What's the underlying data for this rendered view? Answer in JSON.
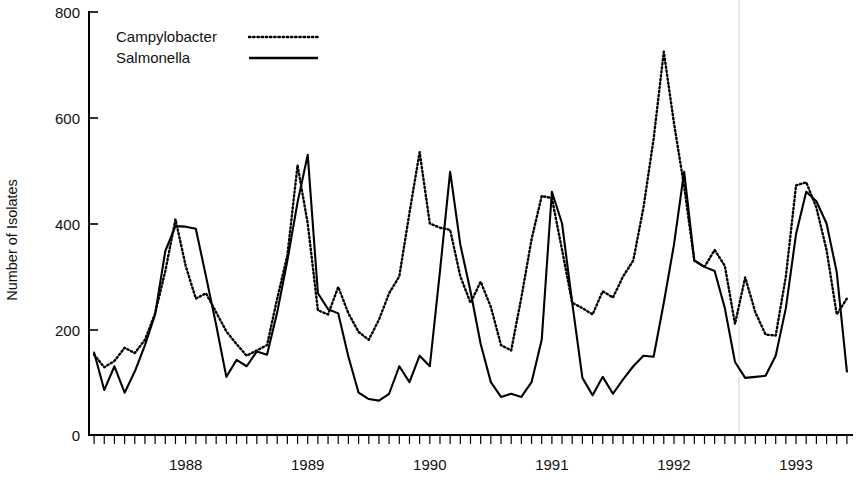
{
  "chart_data": {
    "type": "line",
    "title": "",
    "subtitle": "",
    "xlabel": "",
    "ylabel": "Number of Isolates",
    "ylim": [
      0,
      800
    ],
    "yticks": [
      0,
      200,
      400,
      600,
      800
    ],
    "ytick_labels": [
      "0",
      "200",
      "400",
      "600",
      "800"
    ],
    "xlim": [
      "1987-10",
      "1993-12"
    ],
    "xtick_labels": [
      "1988",
      "1989",
      "1990",
      "1991",
      "1992",
      "1993"
    ],
    "xtick_positions": [
      "1988-07",
      "1989-07",
      "1990-07",
      "1991-07",
      "1992-07",
      "1993-07"
    ],
    "x_minor_ticks": "monthly",
    "grid": false,
    "legend_position": "top-left",
    "legend": [
      "Campylobacter",
      "Salmonella"
    ],
    "x": [
      "1987-10",
      "1987-11",
      "1987-12",
      "1988-01",
      "1988-02",
      "1988-03",
      "1988-04",
      "1988-05",
      "1988-06",
      "1988-07",
      "1988-08",
      "1988-09",
      "1988-10",
      "1988-11",
      "1988-12",
      "1989-01",
      "1989-02",
      "1989-03",
      "1989-04",
      "1989-05",
      "1989-06",
      "1989-07",
      "1989-08",
      "1989-09",
      "1989-10",
      "1989-11",
      "1989-12",
      "1990-01",
      "1990-02",
      "1990-03",
      "1990-04",
      "1990-05",
      "1990-06",
      "1990-07",
      "1990-08",
      "1990-09",
      "1990-10",
      "1990-11",
      "1990-12",
      "1991-01",
      "1991-02",
      "1991-03",
      "1991-04",
      "1991-05",
      "1991-06",
      "1991-07",
      "1991-08",
      "1991-09",
      "1991-10",
      "1991-11",
      "1991-12",
      "1992-01",
      "1992-02",
      "1992-03",
      "1992-04",
      "1992-05",
      "1992-06",
      "1992-07",
      "1992-08",
      "1992-09",
      "1992-10",
      "1992-11",
      "1992-12",
      "1993-01",
      "1993-02",
      "1993-03",
      "1993-04",
      "1993-05",
      "1993-06",
      "1993-07",
      "1993-08",
      "1993-09",
      "1993-10",
      "1993-11",
      "1993-12"
    ],
    "series": [
      {
        "name": "Campylobacter",
        "style": "dotted",
        "color": "#000000",
        "values": [
          152,
          128,
          140,
          165,
          155,
          180,
          230,
          310,
          408,
          320,
          258,
          268,
          232,
          196,
          172,
          150,
          160,
          170,
          258,
          340,
          510,
          400,
          236,
          228,
          280,
          230,
          195,
          180,
          218,
          268,
          300,
          420,
          535,
          400,
          392,
          388,
          300,
          250,
          290,
          242,
          170,
          160,
          260,
          370,
          452,
          448,
          350,
          250,
          240,
          228,
          272,
          260,
          300,
          330,
          430,
          560,
          725,
          590,
          470,
          330,
          318,
          350,
          320,
          210,
          298,
          232,
          190,
          188,
          300,
          472,
          478,
          430,
          350,
          228,
          258
        ]
      },
      {
        "name": "Salmonella",
        "style": "solid",
        "color": "#000000",
        "values": [
          156,
          85,
          130,
          80,
          120,
          170,
          228,
          348,
          395,
          394,
          390,
          300,
          208,
          110,
          142,
          130,
          158,
          152,
          232,
          330,
          440,
          530,
          268,
          238,
          230,
          148,
          80,
          68,
          65,
          78,
          130,
          100,
          150,
          130,
          310,
          498,
          360,
          272,
          172,
          100,
          72,
          78,
          72,
          100,
          180,
          460,
          400,
          250,
          108,
          75,
          110,
          78,
          105,
          130,
          150,
          148,
          250,
          360,
          498,
          330,
          318,
          310,
          240,
          138,
          108,
          110,
          112,
          150,
          240,
          380,
          460,
          442,
          400,
          308,
          120
        ]
      }
    ]
  },
  "legend": {
    "campylobacter": {
      "label": "Campylobacter",
      "swatch": "dotted-line-swatch"
    },
    "salmonella": {
      "label": "Salmonella",
      "swatch": "solid-line-swatch"
    }
  },
  "y_axis": {
    "title": "Number of Isolates",
    "labels": [
      "800",
      "600",
      "400",
      "200",
      "0"
    ]
  },
  "x_axis": {
    "labels": [
      "1988",
      "1989",
      "1990",
      "1991",
      "1992",
      "1993"
    ]
  }
}
